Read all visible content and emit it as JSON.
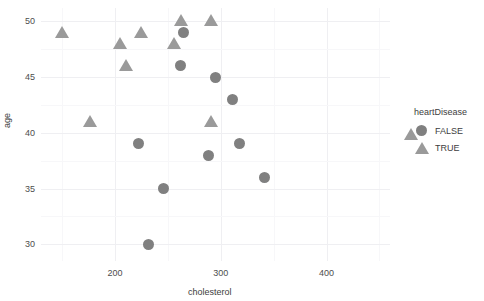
{
  "chart_data": {
    "type": "scatter",
    "title": "",
    "xlabel": "cholesterol",
    "ylabel": "age",
    "xlim": [
      130,
      460
    ],
    "ylim": [
      28.5,
      51.2
    ],
    "xticks": [
      200,
      300,
      400
    ],
    "yticks": [
      30,
      35,
      40,
      45,
      50
    ],
    "xtick_labels": [
      "200",
      "300",
      "400"
    ],
    "ytick_labels": [
      "30",
      "35",
      "40",
      "45",
      "50"
    ],
    "grid": true,
    "legend": {
      "title": "heartDisease",
      "position": "right",
      "entries": [
        {
          "label": "FALSE",
          "marker": "circle",
          "color": "#808080"
        },
        {
          "label": "TRUE",
          "marker": "triangle",
          "color": "#9a9a9a"
        }
      ]
    },
    "series": [
      {
        "name": "FALSE",
        "marker": "circle",
        "color": "#808080",
        "points": [
          {
            "x": 265,
            "y": 49
          },
          {
            "x": 262,
            "y": 46
          },
          {
            "x": 295,
            "y": 45
          },
          {
            "x": 311,
            "y": 43
          },
          {
            "x": 222,
            "y": 39
          },
          {
            "x": 318,
            "y": 39
          },
          {
            "x": 288,
            "y": 38
          },
          {
            "x": 341,
            "y": 36
          },
          {
            "x": 246,
            "y": 35
          },
          {
            "x": 232,
            "y": 30
          }
        ]
      },
      {
        "name": "TRUE",
        "marker": "triangle",
        "color": "#9a9a9a",
        "points": [
          {
            "x": 150,
            "y": 49
          },
          {
            "x": 225,
            "y": 49
          },
          {
            "x": 205,
            "y": 48
          },
          {
            "x": 256,
            "y": 48
          },
          {
            "x": 262,
            "y": 50
          },
          {
            "x": 291,
            "y": 50
          },
          {
            "x": 210,
            "y": 46
          },
          {
            "x": 176,
            "y": 41
          },
          {
            "x": 291,
            "y": 41
          }
        ]
      }
    ],
    "colors": {
      "background": "#ffffff",
      "gridline_major": "#efeff2",
      "gridline_minor": "#f7f7f9",
      "axis_text": "#4d4d4d",
      "axis_title": "#3d3d3d"
    }
  }
}
